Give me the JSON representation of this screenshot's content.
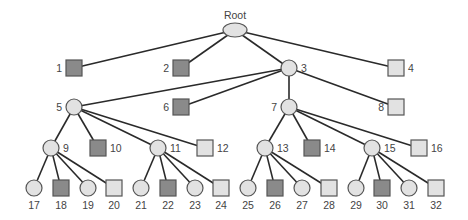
{
  "diagram": {
    "type": "tree",
    "colors": {
      "dark_fill": "#8a8a8a",
      "light_fill": "#e2e2e2",
      "stroke": "#555555",
      "edge": "#2a2a2a",
      "label": "#444444"
    },
    "root": {
      "id": "root",
      "label": "Root",
      "shape": "ellipse",
      "x": 235,
      "y": 30
    },
    "nodes": [
      {
        "id": "1",
        "label": "1",
        "shape": "square",
        "fill": "dark",
        "x": 74,
        "y": 68,
        "parent": "root",
        "label_pos": "left"
      },
      {
        "id": "2",
        "label": "2",
        "shape": "square",
        "fill": "dark",
        "x": 181,
        "y": 68,
        "parent": "root",
        "label_pos": "left"
      },
      {
        "id": "3",
        "label": "3",
        "shape": "circle",
        "fill": "light",
        "x": 289,
        "y": 68,
        "parent": "root",
        "label_pos": "right"
      },
      {
        "id": "4",
        "label": "4",
        "shape": "square",
        "fill": "light",
        "x": 396,
        "y": 68,
        "parent": "root",
        "label_pos": "right"
      },
      {
        "id": "5",
        "label": "5",
        "shape": "circle",
        "fill": "light",
        "x": 74,
        "y": 107,
        "parent": "3",
        "label_pos": "left"
      },
      {
        "id": "6",
        "label": "6",
        "shape": "square",
        "fill": "dark",
        "x": 181,
        "y": 107,
        "parent": "3",
        "label_pos": "left"
      },
      {
        "id": "7",
        "label": "7",
        "shape": "circle",
        "fill": "light",
        "x": 289,
        "y": 107,
        "parent": "3",
        "label_pos": "left"
      },
      {
        "id": "8",
        "label": "8",
        "shape": "square",
        "fill": "light",
        "x": 396,
        "y": 107,
        "parent": "3",
        "label_pos": "left"
      },
      {
        "id": "9",
        "label": "9",
        "shape": "circle",
        "fill": "light",
        "x": 51,
        "y": 148,
        "parent": "5",
        "label_pos": "right"
      },
      {
        "id": "10",
        "label": "10",
        "shape": "square",
        "fill": "dark",
        "x": 98,
        "y": 148,
        "parent": "5",
        "label_pos": "right"
      },
      {
        "id": "11",
        "label": "11",
        "shape": "circle",
        "fill": "light",
        "x": 158,
        "y": 148,
        "parent": "5",
        "label_pos": "right"
      },
      {
        "id": "12",
        "label": "12",
        "shape": "square",
        "fill": "light",
        "x": 205,
        "y": 148,
        "parent": "5",
        "label_pos": "right"
      },
      {
        "id": "13",
        "label": "13",
        "shape": "circle",
        "fill": "light",
        "x": 265,
        "y": 148,
        "parent": "7",
        "label_pos": "right"
      },
      {
        "id": "14",
        "label": "14",
        "shape": "square",
        "fill": "dark",
        "x": 312,
        "y": 148,
        "parent": "7",
        "label_pos": "right"
      },
      {
        "id": "15",
        "label": "15",
        "shape": "circle",
        "fill": "light",
        "x": 372,
        "y": 148,
        "parent": "7",
        "label_pos": "right"
      },
      {
        "id": "16",
        "label": "16",
        "shape": "square",
        "fill": "light",
        "x": 419,
        "y": 148,
        "parent": "7",
        "label_pos": "right"
      },
      {
        "id": "17",
        "label": "17",
        "shape": "circle",
        "fill": "light",
        "x": 34,
        "y": 188,
        "parent": "9",
        "label_pos": "below"
      },
      {
        "id": "18",
        "label": "18",
        "shape": "square",
        "fill": "dark",
        "x": 61,
        "y": 188,
        "parent": "9",
        "label_pos": "below"
      },
      {
        "id": "19",
        "label": "19",
        "shape": "circle",
        "fill": "light",
        "x": 88,
        "y": 188,
        "parent": "9",
        "label_pos": "below"
      },
      {
        "id": "20",
        "label": "20",
        "shape": "square",
        "fill": "light",
        "x": 114,
        "y": 188,
        "parent": "9",
        "label_pos": "below"
      },
      {
        "id": "21",
        "label": "21",
        "shape": "circle",
        "fill": "light",
        "x": 141,
        "y": 188,
        "parent": "11",
        "label_pos": "below"
      },
      {
        "id": "22",
        "label": "22",
        "shape": "square",
        "fill": "dark",
        "x": 168,
        "y": 188,
        "parent": "11",
        "label_pos": "below"
      },
      {
        "id": "23",
        "label": "23",
        "shape": "circle",
        "fill": "light",
        "x": 195,
        "y": 188,
        "parent": "11",
        "label_pos": "below"
      },
      {
        "id": "24",
        "label": "24",
        "shape": "square",
        "fill": "light",
        "x": 221,
        "y": 188,
        "parent": "11",
        "label_pos": "below"
      },
      {
        "id": "25",
        "label": "25",
        "shape": "circle",
        "fill": "light",
        "x": 248,
        "y": 188,
        "parent": "13",
        "label_pos": "below"
      },
      {
        "id": "26",
        "label": "26",
        "shape": "square",
        "fill": "dark",
        "x": 275,
        "y": 188,
        "parent": "13",
        "label_pos": "below"
      },
      {
        "id": "27",
        "label": "27",
        "shape": "circle",
        "fill": "light",
        "x": 302,
        "y": 188,
        "parent": "13",
        "label_pos": "below"
      },
      {
        "id": "28",
        "label": "28",
        "shape": "square",
        "fill": "light",
        "x": 329,
        "y": 188,
        "parent": "13",
        "label_pos": "below"
      },
      {
        "id": "29",
        "label": "29",
        "shape": "circle",
        "fill": "light",
        "x": 356,
        "y": 188,
        "parent": "15",
        "label_pos": "below"
      },
      {
        "id": "30",
        "label": "30",
        "shape": "square",
        "fill": "dark",
        "x": 382,
        "y": 188,
        "parent": "15",
        "label_pos": "below"
      },
      {
        "id": "31",
        "label": "31",
        "shape": "circle",
        "fill": "light",
        "x": 409,
        "y": 188,
        "parent": "15",
        "label_pos": "below"
      },
      {
        "id": "32",
        "label": "32",
        "shape": "square",
        "fill": "light",
        "x": 436,
        "y": 188,
        "parent": "15",
        "label_pos": "below"
      }
    ]
  }
}
